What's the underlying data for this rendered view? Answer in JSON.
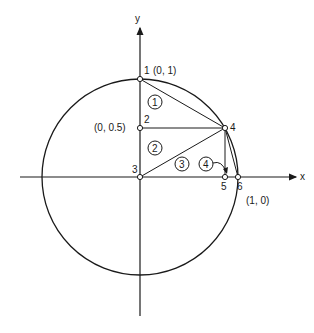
{
  "diagram": {
    "axes": {
      "x_label": "x",
      "y_label": "y"
    },
    "points": [
      {
        "id": "1",
        "label": "1",
        "coord_label": "(0, 1)"
      },
      {
        "id": "2",
        "label": "2",
        "coord_label": "(0, 0.5)"
      },
      {
        "id": "3",
        "label": "3",
        "coord_label": ""
      },
      {
        "id": "4",
        "label": "4",
        "coord_label": ""
      },
      {
        "id": "5",
        "label": "5",
        "coord_label": ""
      },
      {
        "id": "6",
        "label": "6",
        "coord_label": "(1, 0)"
      }
    ],
    "regions": [
      {
        "id": "r1",
        "label": "1"
      },
      {
        "id": "r2",
        "label": "2"
      },
      {
        "id": "r3",
        "label": "3"
      },
      {
        "id": "r4",
        "label": "4"
      }
    ],
    "stroke_color": "#1a1a1a",
    "background": "#ffffff"
  }
}
